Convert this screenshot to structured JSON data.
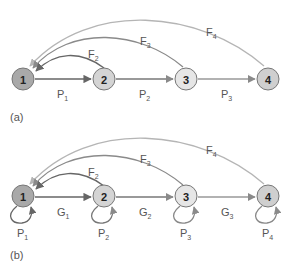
{
  "diagram": {
    "panels": [
      {
        "label": "(a)",
        "nodes": [
          {
            "id": "1",
            "fill": "#a9a9a9"
          },
          {
            "id": "2",
            "fill": "#d4d4d4"
          },
          {
            "id": "3",
            "fill": "#e6e6e6"
          },
          {
            "id": "4",
            "fill": "#cfcfcf"
          }
        ],
        "forward_edges": [
          {
            "from": "1",
            "to": "2",
            "label": "P",
            "sub": "1"
          },
          {
            "from": "2",
            "to": "3",
            "label": "P",
            "sub": "2"
          },
          {
            "from": "3",
            "to": "4",
            "label": "P",
            "sub": "3"
          }
        ],
        "feedback_edges": [
          {
            "from": "2",
            "to": "1",
            "label": "F",
            "sub": "2"
          },
          {
            "from": "3",
            "to": "1",
            "label": "F",
            "sub": "3"
          },
          {
            "from": "4",
            "to": "1",
            "label": "F",
            "sub": "4"
          }
        ]
      },
      {
        "label": "(b)",
        "nodes": [
          {
            "id": "1",
            "fill": "#a9a9a9"
          },
          {
            "id": "2",
            "fill": "#d4d4d4"
          },
          {
            "id": "3",
            "fill": "#e6e6e6"
          },
          {
            "id": "4",
            "fill": "#cfcfcf"
          }
        ],
        "forward_edges": [
          {
            "from": "1",
            "to": "2",
            "label": "G",
            "sub": "1"
          },
          {
            "from": "2",
            "to": "3",
            "label": "G",
            "sub": "2"
          },
          {
            "from": "3",
            "to": "4",
            "label": "G",
            "sub": "3"
          }
        ],
        "feedback_edges": [
          {
            "from": "2",
            "to": "1",
            "label": "F",
            "sub": "2"
          },
          {
            "from": "3",
            "to": "1",
            "label": "F",
            "sub": "3"
          },
          {
            "from": "4",
            "to": "1",
            "label": "F",
            "sub": "4"
          }
        ],
        "self_loops": [
          {
            "node": "1",
            "label": "P",
            "sub": "1"
          },
          {
            "node": "2",
            "label": "P",
            "sub": "2"
          },
          {
            "node": "3",
            "label": "P",
            "sub": "3"
          },
          {
            "node": "4",
            "label": "P",
            "sub": "4"
          }
        ]
      }
    ],
    "colors": {
      "edge_dark": "#666666",
      "edge_mid": "#8a8a8a",
      "edge_light": "#b5b5b5",
      "node_stroke": "#777777"
    }
  }
}
